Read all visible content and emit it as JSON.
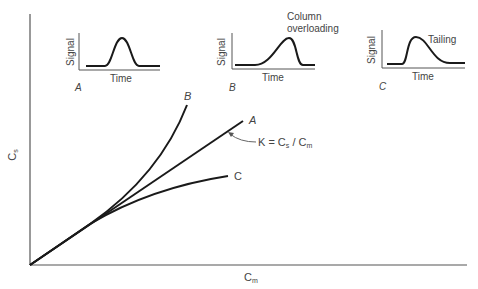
{
  "figure": {
    "axes": {
      "y_label": "C",
      "y_label_sub": "s",
      "x_label": "C",
      "x_label_sub": "m"
    },
    "curves": [
      {
        "id": "A",
        "label": "A",
        "shape": "linear"
      },
      {
        "id": "B",
        "label": "B",
        "shape": "convex upward (anti-Langmuir)"
      },
      {
        "id": "C",
        "label": "C",
        "shape": "concave (Langmuir)"
      }
    ],
    "annotation": {
      "k_text": "K = C",
      "k_sub1": "s",
      "k_mid": " / C",
      "k_sub2": "m"
    },
    "insets": [
      {
        "id": "A",
        "panel_label": "A",
        "y_axis": "Signal",
        "x_axis": "Time",
        "note": "",
        "peak": "symmetric"
      },
      {
        "id": "B",
        "panel_label": "B",
        "y_axis": "Signal",
        "x_axis": "Time",
        "note_line1": "Column",
        "note_line2": "overloading",
        "peak": "fronting"
      },
      {
        "id": "C",
        "panel_label": "C",
        "y_axis": "Signal",
        "x_axis": "Time",
        "note": "Tailing",
        "peak": "tailing"
      }
    ]
  }
}
